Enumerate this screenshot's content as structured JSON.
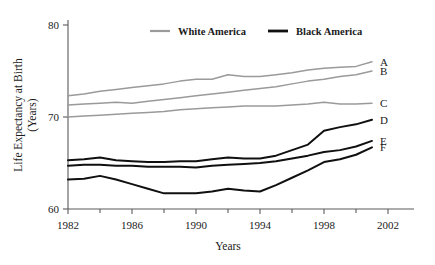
{
  "chart_data": {
    "type": "line",
    "title": "",
    "xlabel": "Years",
    "ylabel": "Life Expectancy at Birth (Years)",
    "ylabel_line1": "Life Expectancy at Birth",
    "ylabel_line2": "(Years)",
    "xlim": [
      1982,
      2002
    ],
    "ylim": [
      60,
      80
    ],
    "grid": false,
    "legend_position": "top-center",
    "x_tick_labels": [
      "1982",
      "1986",
      "1990",
      "1994",
      "1998",
      "2002"
    ],
    "x_major_ticks": [
      1982,
      1986,
      1990,
      1994,
      1998,
      2002
    ],
    "x_minor_ticks": [
      1984,
      1988,
      1992,
      1996,
      2000
    ],
    "y_tick_labels": [
      "60",
      "70",
      "80"
    ],
    "y_ticks": [
      60,
      70,
      80
    ],
    "legend": [
      {
        "name": "White America",
        "color": "#9a9a9a"
      },
      {
        "name": "Black America",
        "color": "#101010"
      }
    ],
    "x": [
      1982,
      1983,
      1984,
      1985,
      1986,
      1987,
      1988,
      1989,
      1990,
      1991,
      1992,
      1993,
      1994,
      1995,
      1996,
      1997,
      1998,
      1999,
      2000,
      2001
    ],
    "series": [
      {
        "name": "A",
        "group": "White America",
        "color": "#9a9a9a",
        "end_label": "A",
        "values": [
          72.3,
          72.5,
          72.8,
          73.0,
          73.2,
          73.4,
          73.6,
          73.9,
          74.1,
          74.1,
          74.6,
          74.4,
          74.4,
          74.6,
          74.8,
          75.1,
          75.3,
          75.4,
          75.5,
          76.0
        ]
      },
      {
        "name": "B",
        "group": "White America",
        "color": "#9a9a9a",
        "end_label": "B",
        "values": [
          71.3,
          71.4,
          71.5,
          71.6,
          71.5,
          71.7,
          71.9,
          72.1,
          72.3,
          72.5,
          72.7,
          72.9,
          73.1,
          73.3,
          73.6,
          73.9,
          74.1,
          74.4,
          74.6,
          75.0
        ]
      },
      {
        "name": "C",
        "group": "White America",
        "color": "#9a9a9a",
        "end_label": "C",
        "values": [
          70.0,
          70.1,
          70.2,
          70.3,
          70.4,
          70.5,
          70.6,
          70.8,
          70.9,
          71.0,
          71.1,
          71.2,
          71.2,
          71.2,
          71.3,
          71.4,
          71.6,
          71.4,
          71.4,
          71.5
        ]
      },
      {
        "name": "D",
        "group": "Black America",
        "color": "#101010",
        "end_label": "D",
        "values": [
          65.3,
          65.4,
          65.6,
          65.3,
          65.2,
          65.1,
          65.1,
          65.2,
          65.2,
          65.4,
          65.6,
          65.5,
          65.5,
          65.8,
          66.4,
          67.0,
          68.5,
          68.9,
          69.2,
          69.7
        ]
      },
      {
        "name": "E",
        "group": "Black America",
        "color": "#101010",
        "end_label": "E",
        "values": [
          64.7,
          64.8,
          64.8,
          64.7,
          64.7,
          64.6,
          64.6,
          64.6,
          64.5,
          64.7,
          64.8,
          64.9,
          65.0,
          65.2,
          65.5,
          65.8,
          66.2,
          66.4,
          66.8,
          67.4
        ]
      },
      {
        "name": "F",
        "group": "Black America",
        "color": "#101010",
        "end_label": "F",
        "values": [
          63.2,
          63.3,
          63.6,
          63.2,
          62.7,
          62.2,
          61.7,
          61.7,
          61.7,
          61.9,
          62.2,
          62.0,
          61.9,
          62.6,
          63.4,
          64.2,
          65.1,
          65.4,
          65.9,
          66.7
        ]
      }
    ]
  }
}
